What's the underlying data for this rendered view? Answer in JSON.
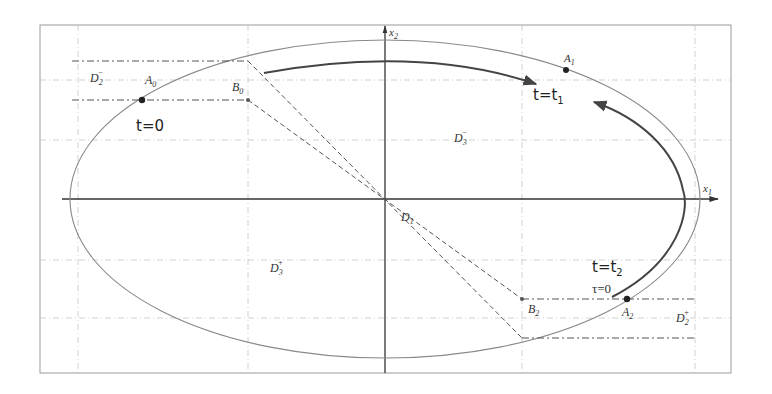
{
  "diagram": {
    "frame": {
      "x1": 40,
      "y1": 25,
      "x2": 731,
      "y2": 373
    },
    "grid": {
      "vertical": [
        78,
        248,
        522,
        695
      ],
      "horizontal": [
        80,
        140,
        260,
        318
      ],
      "color": "#bdbdbd"
    },
    "axes": {
      "origin": {
        "x": 385,
        "y": 199
      },
      "x_label": "x",
      "x_sub": "1",
      "y_label": "x",
      "y_sub": "2"
    },
    "ellipse": {
      "cx": 385,
      "cy": 199,
      "rx": 315,
      "ry": 159
    },
    "labels": {
      "D2_minus": {
        "main": "D",
        "sub": "2",
        "sup": "−"
      },
      "D2_plus": {
        "main": "D",
        "sub": "2",
        "sup": "+"
      },
      "D3_minus": {
        "main": "D",
        "sub": "3",
        "sup": "−"
      },
      "D3_plus": {
        "main": "D",
        "sub": "3",
        "sup": "+"
      },
      "D1": {
        "main": "D",
        "sub": "1"
      },
      "A0": {
        "main": "A",
        "sub": "0"
      },
      "A1": {
        "main": "A",
        "sub": "1"
      },
      "A2": {
        "main": "A",
        "sub": "2"
      },
      "B0": {
        "main": "B",
        "sub": "0"
      },
      "B2": {
        "main": "B",
        "sub": "2"
      },
      "t0": "t=0",
      "t1_main": "t=t",
      "t1_sub": "1",
      "t2_main": "t=t",
      "t2_sub": "2",
      "tau0": "τ=0"
    },
    "points": {
      "A0": {
        "x": 142,
        "y": 100
      },
      "A1": {
        "x": 566,
        "y": 70
      },
      "A2": {
        "x": 627,
        "y": 299
      },
      "B0": {
        "x": 248,
        "y": 100
      },
      "B2": {
        "x": 522,
        "y": 299
      }
    },
    "colors": {
      "ellipse": "#888888",
      "trajectory": "#444444",
      "axis": "#333333",
      "dashed": "#555555"
    }
  }
}
